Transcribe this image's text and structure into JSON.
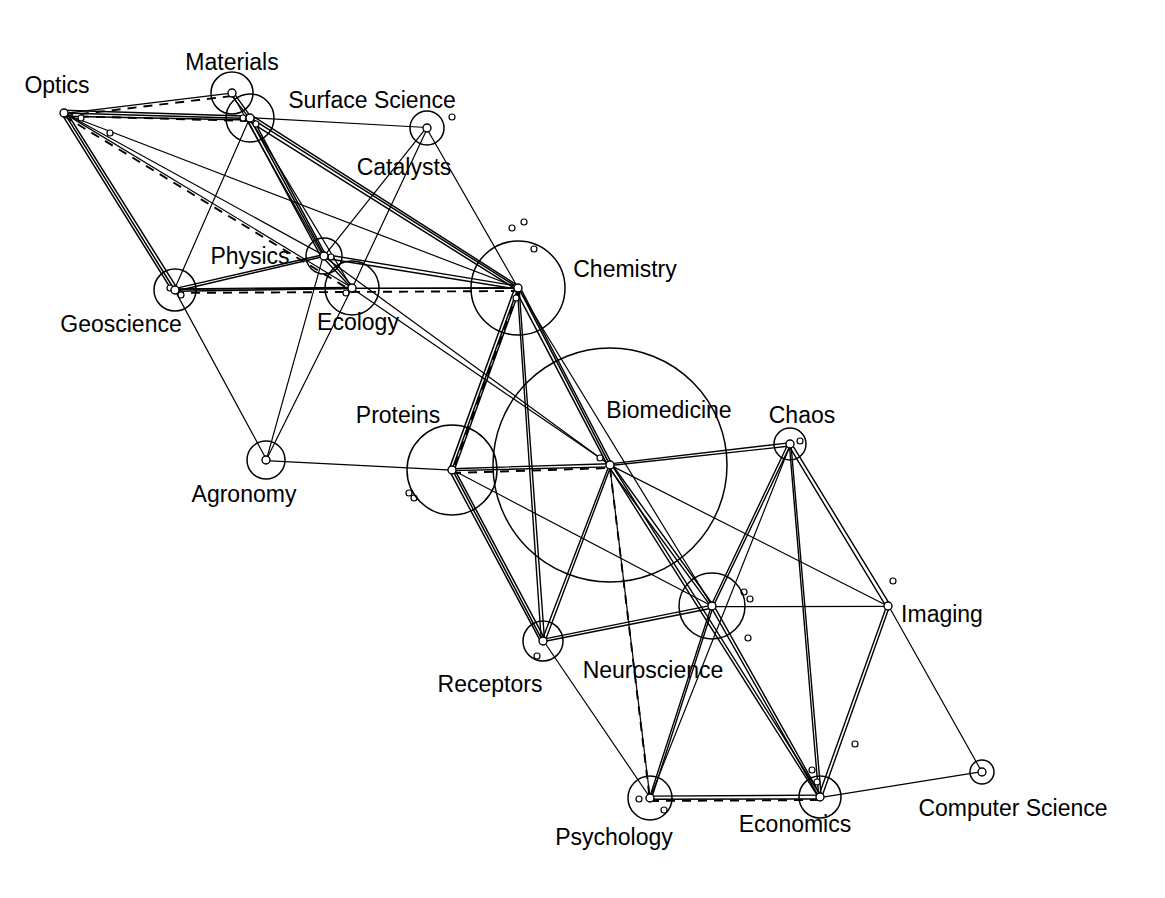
{
  "diagram": {
    "type": "network-graph",
    "background_color": "#ffffff",
    "line_color": "#000000",
    "label_font_size_px": 23,
    "width": 1165,
    "height": 898,
    "nodes": [
      {
        "id": "optics",
        "label": "Optics",
        "x": 64,
        "y": 113,
        "r": 4,
        "halo": 0,
        "label_x": 57,
        "label_y": 93,
        "anchor": "middle"
      },
      {
        "id": "materials",
        "label": "Materials",
        "x": 232,
        "y": 93,
        "r": 4,
        "halo": 21,
        "label_x": 232,
        "label_y": 70,
        "anchor": "middle"
      },
      {
        "id": "surface",
        "label": "Surface Science",
        "x": 250,
        "y": 118,
        "r": 4,
        "halo": 24,
        "label_x": 372,
        "label_y": 108,
        "anchor": "middle"
      },
      {
        "id": "catalysts",
        "label": "Catalysts",
        "x": 427,
        "y": 128,
        "r": 4,
        "halo": 17,
        "label_x": 404,
        "label_y": 175,
        "anchor": "middle"
      },
      {
        "id": "physics",
        "label": "Physics",
        "x": 324,
        "y": 256,
        "r": 4,
        "halo": 18,
        "label_x": 250,
        "label_y": 264,
        "anchor": "middle"
      },
      {
        "id": "geoscience",
        "label": "Geoscience",
        "x": 175,
        "y": 290,
        "r": 4,
        "halo": 21,
        "label_x": 121,
        "label_y": 332,
        "anchor": "middle"
      },
      {
        "id": "ecology",
        "label": "Ecology",
        "x": 352,
        "y": 288,
        "r": 4,
        "halo": 27,
        "label_x": 358,
        "label_y": 330,
        "anchor": "middle"
      },
      {
        "id": "chemistry",
        "label": "Chemistry",
        "x": 518,
        "y": 288,
        "r": 4,
        "halo": 47,
        "label_x": 625,
        "label_y": 277,
        "anchor": "middle"
      },
      {
        "id": "agronomy",
        "label": "Agronomy",
        "x": 266,
        "y": 460,
        "r": 4,
        "halo": 19,
        "label_x": 244,
        "label_y": 502,
        "anchor": "middle"
      },
      {
        "id": "proteins",
        "label": "Proteins",
        "x": 452,
        "y": 470,
        "r": 4,
        "halo": 45,
        "label_x": 398,
        "label_y": 423,
        "anchor": "middle"
      },
      {
        "id": "biomedicine",
        "label": "Biomedicine",
        "x": 610,
        "y": 465,
        "r": 4,
        "halo": 117,
        "label_x": 669,
        "label_y": 418,
        "anchor": "middle"
      },
      {
        "id": "chaos",
        "label": "Chaos",
        "x": 790,
        "y": 444,
        "r": 4,
        "halo": 16,
        "label_x": 802,
        "label_y": 423,
        "anchor": "middle"
      },
      {
        "id": "receptors",
        "label": "Receptors",
        "x": 543,
        "y": 641,
        "r": 4,
        "halo": 20,
        "label_x": 490,
        "label_y": 692,
        "anchor": "middle"
      },
      {
        "id": "neuroscience",
        "label": "Neuroscience",
        "x": 712,
        "y": 606,
        "r": 4,
        "halo": 33,
        "label_x": 653,
        "label_y": 678,
        "anchor": "middle"
      },
      {
        "id": "imaging",
        "label": "Imaging",
        "x": 888,
        "y": 606,
        "r": 4,
        "halo": 0,
        "label_x": 942,
        "label_y": 622,
        "anchor": "middle"
      },
      {
        "id": "psychology",
        "label": "Psychology",
        "x": 650,
        "y": 798,
        "r": 4,
        "halo": 22,
        "label_x": 614,
        "label_y": 845,
        "anchor": "middle"
      },
      {
        "id": "economics",
        "label": "Economics",
        "x": 820,
        "y": 797,
        "r": 4,
        "halo": 21,
        "label_x": 795,
        "label_y": 832,
        "anchor": "middle"
      },
      {
        "id": "compsci",
        "label": "Computer Science",
        "x": 982,
        "y": 772,
        "r": 4,
        "halo": 12,
        "label_x": 1013,
        "label_y": 816,
        "anchor": "middle"
      }
    ],
    "satellite_points": [
      {
        "id": "s1",
        "x": 81,
        "y": 118,
        "r": 3
      },
      {
        "id": "s2",
        "x": 110,
        "y": 133,
        "r": 3
      },
      {
        "id": "s3",
        "x": 243,
        "y": 118,
        "r": 3
      },
      {
        "id": "s4",
        "x": 256,
        "y": 124,
        "r": 3
      },
      {
        "id": "s5",
        "x": 452,
        "y": 117,
        "r": 3
      },
      {
        "id": "s6",
        "x": 331,
        "y": 257,
        "r": 3
      },
      {
        "id": "s7",
        "x": 170,
        "y": 288,
        "r": 3
      },
      {
        "id": "s8",
        "x": 181,
        "y": 295,
        "r": 3
      },
      {
        "id": "s9",
        "x": 346,
        "y": 293,
        "r": 3
      },
      {
        "id": "s10",
        "x": 512,
        "y": 228,
        "r": 3
      },
      {
        "id": "s11",
        "x": 524,
        "y": 222,
        "r": 3
      },
      {
        "id": "s12",
        "x": 534,
        "y": 249,
        "r": 3
      },
      {
        "id": "s13",
        "x": 516,
        "y": 298,
        "r": 3
      },
      {
        "id": "s14",
        "x": 409,
        "y": 493,
        "r": 3
      },
      {
        "id": "s15",
        "x": 414,
        "y": 498,
        "r": 3
      },
      {
        "id": "s16",
        "x": 600,
        "y": 458,
        "r": 3
      },
      {
        "id": "s17",
        "x": 800,
        "y": 441,
        "r": 3
      },
      {
        "id": "s18",
        "x": 537,
        "y": 656,
        "r": 3
      },
      {
        "id": "s19",
        "x": 744,
        "y": 592,
        "r": 3
      },
      {
        "id": "s20",
        "x": 750,
        "y": 599,
        "r": 3
      },
      {
        "id": "s21",
        "x": 748,
        "y": 638,
        "r": 3
      },
      {
        "id": "s22",
        "x": 893,
        "y": 581,
        "r": 3
      },
      {
        "id": "s23",
        "x": 855,
        "y": 744,
        "r": 3
      },
      {
        "id": "s24",
        "x": 812,
        "y": 770,
        "r": 3
      },
      {
        "id": "s25",
        "x": 817,
        "y": 782,
        "r": 3
      },
      {
        "id": "s26",
        "x": 664,
        "y": 810,
        "r": 3
      },
      {
        "id": "s27",
        "x": 639,
        "y": 799,
        "r": 3
      }
    ],
    "edges": [
      {
        "from": "optics",
        "to": "materials",
        "w": 1.4
      },
      {
        "from": "optics",
        "to": "surface",
        "w": 2.6
      },
      {
        "from": "optics",
        "to": "physics",
        "w": 1.2
      },
      {
        "from": "optics",
        "to": "geoscience",
        "w": 2.4
      },
      {
        "from": "optics",
        "to": "ecology",
        "w": 1.1
      },
      {
        "from": "optics",
        "to": "chemistry",
        "w": 1.1
      },
      {
        "from": "materials",
        "to": "surface",
        "w": 1.6
      },
      {
        "from": "materials",
        "to": "physics",
        "w": 1.2
      },
      {
        "from": "surface",
        "to": "catalysts",
        "w": 1.2
      },
      {
        "from": "surface",
        "to": "physics",
        "w": 2.8
      },
      {
        "from": "surface",
        "to": "geoscience",
        "w": 1.4
      },
      {
        "from": "surface",
        "to": "chemistry",
        "w": 2.4
      },
      {
        "from": "surface",
        "to": "ecology",
        "w": 1.1
      },
      {
        "from": "catalysts",
        "to": "chemistry",
        "w": 1.2
      },
      {
        "from": "catalysts",
        "to": "physics",
        "w": 1.1
      },
      {
        "from": "catalysts",
        "to": "ecology",
        "w": 1.1
      },
      {
        "from": "physics",
        "to": "geoscience",
        "w": 2.0
      },
      {
        "from": "physics",
        "to": "ecology",
        "w": 1.6
      },
      {
        "from": "physics",
        "to": "chemistry",
        "w": 2.0
      },
      {
        "from": "physics",
        "to": "agronomy",
        "w": 1.1
      },
      {
        "from": "physics",
        "to": "biomedicine",
        "w": 1.1
      },
      {
        "from": "geoscience",
        "to": "ecology",
        "w": 1.6
      },
      {
        "from": "geoscience",
        "to": "agronomy",
        "w": 1.1
      },
      {
        "from": "geoscience",
        "to": "chemistry",
        "w": 1.4
      },
      {
        "from": "ecology",
        "to": "chemistry",
        "w": 1.4
      },
      {
        "from": "ecology",
        "to": "agronomy",
        "w": 1.1
      },
      {
        "from": "ecology",
        "to": "biomedicine",
        "w": 1.1
      },
      {
        "from": "chemistry",
        "to": "proteins",
        "w": 2.6
      },
      {
        "from": "chemistry",
        "to": "biomedicine",
        "w": 2.8
      },
      {
        "from": "chemistry",
        "to": "receptors",
        "w": 2.0
      },
      {
        "from": "chemistry",
        "to": "neuroscience",
        "w": 1.3
      },
      {
        "from": "agronomy",
        "to": "proteins",
        "w": 1.1
      },
      {
        "from": "proteins",
        "to": "biomedicine",
        "w": 2.0
      },
      {
        "from": "proteins",
        "to": "receptors",
        "w": 2.4
      },
      {
        "from": "proteins",
        "to": "neuroscience",
        "w": 1.3
      },
      {
        "from": "biomedicine",
        "to": "receptors",
        "w": 1.8
      },
      {
        "from": "biomedicine",
        "to": "neuroscience",
        "w": 2.2
      },
      {
        "from": "biomedicine",
        "to": "chaos",
        "w": 1.5
      },
      {
        "from": "biomedicine",
        "to": "imaging",
        "w": 1.2
      },
      {
        "from": "biomedicine",
        "to": "psychology",
        "w": 1.4
      },
      {
        "from": "biomedicine",
        "to": "economics",
        "w": 1.8
      },
      {
        "from": "chaos",
        "to": "neuroscience",
        "w": 2.2
      },
      {
        "from": "chaos",
        "to": "imaging",
        "w": 1.6
      },
      {
        "from": "chaos",
        "to": "economics",
        "w": 1.6
      },
      {
        "from": "chaos",
        "to": "psychology",
        "w": 1.1
      },
      {
        "from": "receptors",
        "to": "neuroscience",
        "w": 1.6
      },
      {
        "from": "receptors",
        "to": "psychology",
        "w": 1.1
      },
      {
        "from": "neuroscience",
        "to": "imaging",
        "w": 1.4
      },
      {
        "from": "neuroscience",
        "to": "psychology",
        "w": 2.2
      },
      {
        "from": "neuroscience",
        "to": "economics",
        "w": 2.2
      },
      {
        "from": "imaging",
        "to": "economics",
        "w": 1.6
      },
      {
        "from": "imaging",
        "to": "compsci",
        "w": 1.1
      },
      {
        "from": "psychology",
        "to": "economics",
        "w": 2.0
      },
      {
        "from": "economics",
        "to": "compsci",
        "w": 1.1
      }
    ],
    "dashed_edges": [
      {
        "from": "optics",
        "to": "surface"
      },
      {
        "from": "optics",
        "to": "materials"
      },
      {
        "from": "optics",
        "to": "ecology"
      },
      {
        "from": "geoscience",
        "to": "chemistry"
      },
      {
        "from": "chemistry",
        "to": "proteins"
      },
      {
        "from": "proteins",
        "to": "biomedicine"
      },
      {
        "from": "biomedicine",
        "to": "psychology"
      },
      {
        "from": "psychology",
        "to": "economics"
      }
    ]
  }
}
